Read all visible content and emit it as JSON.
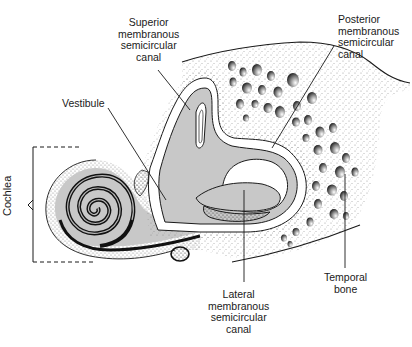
{
  "diagram": {
    "type": "anatomical-illustration",
    "colors": {
      "background": "#ffffff",
      "fluid_fill": "#c8c8c8",
      "outline": "#1a1a1a",
      "stipple": "#555555"
    },
    "labels": {
      "superior": {
        "lines": [
          "Superior",
          "membranous",
          "semicircular",
          "canal"
        ]
      },
      "posterior": {
        "lines": [
          "Posterior",
          "membranous",
          "semicircular",
          "canal"
        ]
      },
      "vestibule": {
        "lines": [
          "Vestibule"
        ]
      },
      "cochlea": {
        "lines": [
          "Cochlea"
        ]
      },
      "lateral": {
        "lines": [
          "Lateral",
          "membranous",
          "semicircular",
          "canal"
        ]
      },
      "temporal_bone": {
        "lines": [
          "Temporal",
          "bone"
        ]
      }
    }
  }
}
